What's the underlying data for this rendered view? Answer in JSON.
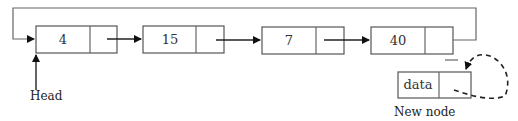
{
  "diagram": {
    "type": "circular-linked-list-insertion",
    "nodes": [
      {
        "value": "4"
      },
      {
        "value": "15"
      },
      {
        "value": "7"
      },
      {
        "value": "40"
      }
    ],
    "new_node": {
      "value": "data",
      "label": "New node"
    },
    "head_label": "Head",
    "colors": {
      "stroke": "#222222",
      "box_stroke": "#555555",
      "background": "#ffffff"
    }
  }
}
